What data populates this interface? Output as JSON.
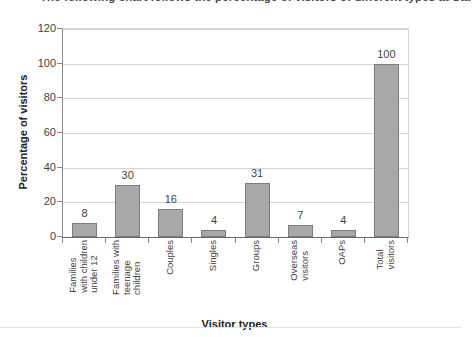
{
  "document": {
    "heading": "The following chart follows the percentage of visitors of different types at Sta"
  },
  "chart_data": {
    "type": "bar",
    "title": "",
    "xlabel": "Visitor types",
    "ylabel": "Percentage of visitors",
    "ylim": [
      0,
      120
    ],
    "ytick_step": 20,
    "ytick_labels": [
      "0",
      "20",
      "40",
      "60",
      "80",
      "100",
      "120"
    ],
    "grid": true,
    "legend": false,
    "bar_color": "#a8a8a8",
    "bar_border_color": "#7d7d7d",
    "categories": [
      "Families with children under 12",
      "Families with teenage children",
      "Couples",
      "Singles",
      "Groups",
      "Overseas visitors",
      "OAPs",
      "Total visitors"
    ],
    "category_lines": [
      [
        "Families",
        "with children",
        "under 12"
      ],
      [
        "Families with",
        "teenage",
        "children"
      ],
      [
        "Couples"
      ],
      [
        "Singles"
      ],
      [
        "Groups"
      ],
      [
        "Overseas",
        "visitors"
      ],
      [
        "OAPs"
      ],
      [
        "Total",
        "visitors"
      ]
    ],
    "values": [
      8,
      30,
      16,
      4,
      31,
      7,
      4,
      100
    ],
    "value_labels": [
      "8",
      "30",
      "16",
      "4",
      "31",
      "7",
      "4",
      "100"
    ]
  }
}
